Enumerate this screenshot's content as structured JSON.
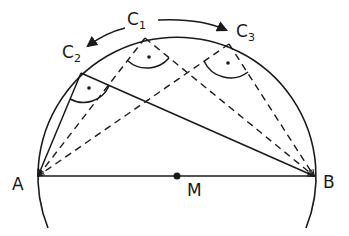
{
  "diagram": {
    "points": {
      "A": {
        "label": "A",
        "x": 38,
        "y": 176
      },
      "B": {
        "label": "B",
        "x": 314,
        "y": 176
      },
      "M": {
        "label": "M",
        "x": 177,
        "y": 176
      },
      "C1": {
        "label": "C",
        "sub": "1",
        "x": 145,
        "y": 38
      },
      "C2": {
        "label": "C",
        "sub": "2",
        "x": 81,
        "y": 73
      },
      "C3": {
        "label": "C",
        "sub": "3",
        "x": 229,
        "y": 44
      }
    },
    "circle": {
      "cx": 177,
      "cy": 176,
      "r": 139
    },
    "segments": {
      "solid": [
        "A-B",
        "A-C2",
        "C2-B"
      ],
      "dashed": [
        "A-C1",
        "C1-B",
        "A-C3",
        "C3-B"
      ]
    },
    "right_angle_marks": [
      "C1",
      "C2",
      "C3"
    ],
    "arrows": [
      "C1 to C2 (counter-clockwise)",
      "C1 to C3 (clockwise)"
    ],
    "colors": {
      "stroke": "#1a1a1a",
      "background": "#ffffff"
    }
  }
}
